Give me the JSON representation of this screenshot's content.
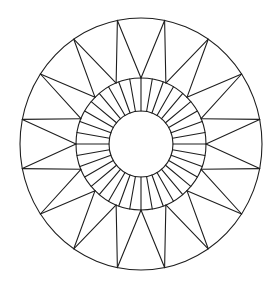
{
  "drawing": {
    "width": 279,
    "height": 284,
    "background": "#ffffff",
    "stroke_color": "#1e1e1e",
    "stroke_width": 1.1,
    "center": [
      141,
      144
    ],
    "outer_circle": {
      "rx": 121,
      "ry": 126
    },
    "middle_ring": {
      "rx": 65,
      "ry": 66
    },
    "inner_circle": {
      "rx": 32,
      "ry": 33
    },
    "star": {
      "points": 16,
      "outer_start_angle_deg": -101.25,
      "inner_start_angle_deg": -90
    },
    "band_radials": {
      "count": 36,
      "start_angle_deg": -90
    }
  }
}
